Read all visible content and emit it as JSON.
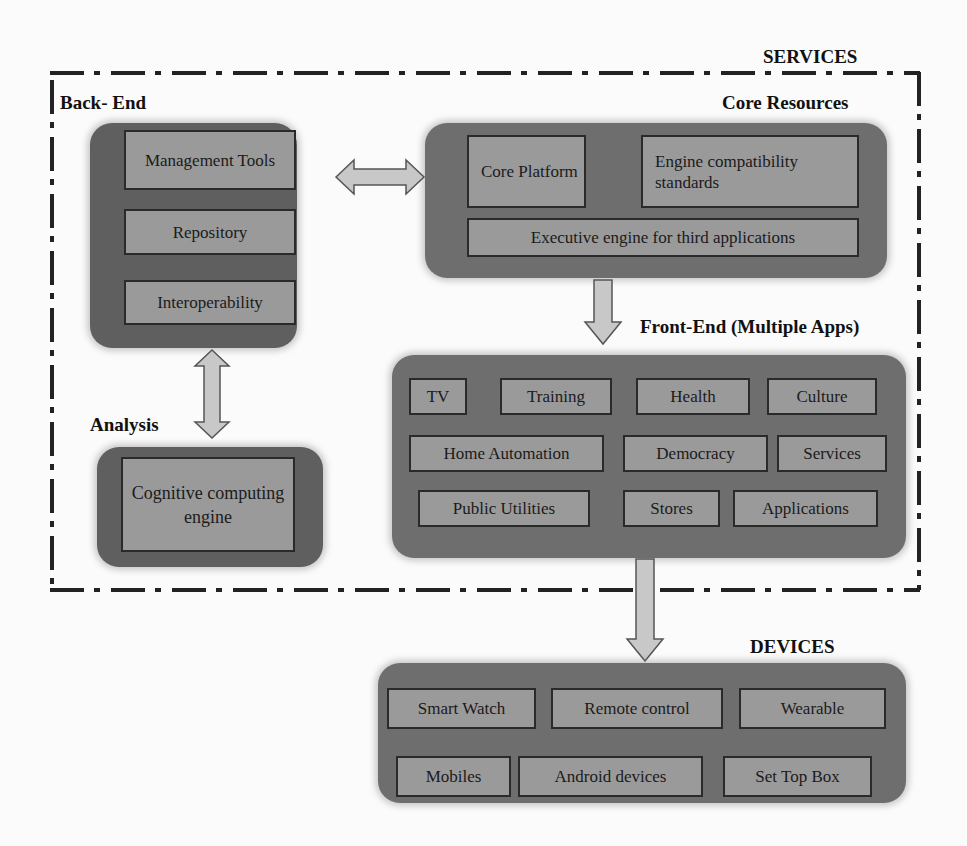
{
  "sections": {
    "services": "SERVICES",
    "back_end": "Back- End",
    "core_resources": "Core Resources",
    "analysis": "Analysis",
    "front_end": "Front-End (Multiple Apps)",
    "devices": "DEVICES"
  },
  "back_end": {
    "items": [
      "Management Tools",
      "Repository",
      "Interoperability"
    ]
  },
  "core_resources": {
    "items": [
      "Core Platform",
      "Engine compatibility standards",
      "Executive engine for third applications"
    ]
  },
  "analysis": {
    "items": [
      "Cognitive computing engine"
    ]
  },
  "front_end": {
    "rows": [
      [
        "TV",
        "Training",
        "Health",
        "Culture"
      ],
      [
        "Home Automation",
        "Democracy",
        "Services"
      ],
      [
        "Public Utilities",
        "Stores",
        "Applications"
      ]
    ]
  },
  "devices": {
    "rows": [
      [
        "Smart Watch",
        "Remote control",
        "Wearable"
      ],
      [
        "Mobiles",
        "Android devices",
        "Set Top Box"
      ]
    ]
  },
  "arrows": [
    {
      "from": "Back-End",
      "to": "Core Resources",
      "type": "bidirectional"
    },
    {
      "from": "Back-End",
      "to": "Analysis",
      "type": "bidirectional"
    },
    {
      "from": "Core Resources",
      "to": "Front-End",
      "type": "down"
    },
    {
      "from": "Front-End",
      "to": "Devices",
      "type": "down"
    }
  ],
  "colors": {
    "panel": "#6e6e6e",
    "box": "#9a9a9a",
    "arrow_fill": "#c8c8c8",
    "border": "#2a2a2a"
  }
}
